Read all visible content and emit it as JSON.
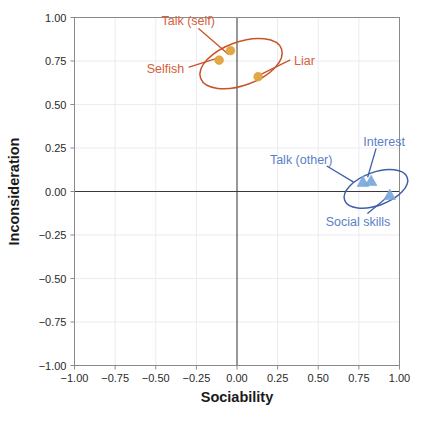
{
  "chart_data": {
    "type": "scatter",
    "title": "",
    "xlabel": "Sociability",
    "ylabel": "Inconsideration",
    "xlim": [
      -1.0,
      1.0
    ],
    "ylim": [
      -1.0,
      1.0
    ],
    "grid": true,
    "legend": "none",
    "zero_lines": true,
    "xticks": [
      "-1.00",
      "-0.75",
      "-0.50",
      "-0.25",
      "0.00",
      "0.25",
      "0.50",
      "0.75",
      "1.00"
    ],
    "xtick_values": [
      -1.0,
      -0.75,
      -0.5,
      -0.25,
      0.0,
      0.25,
      0.5,
      0.75,
      1.0
    ],
    "yticks": [
      "1.00",
      "0.75",
      "0.50",
      "0.25",
      "0.00",
      "-0.25",
      "-0.50",
      "-0.75",
      "-1.00"
    ],
    "ytick_values": [
      1.0,
      0.75,
      0.5,
      0.25,
      0.0,
      -0.25,
      -0.5,
      -0.75,
      -1.0
    ],
    "series": [
      {
        "name": "Negative cluster",
        "color": "#e0a33c",
        "outline_color": "#c8532a",
        "marker": "circle",
        "points": [
          {
            "label": "Talk (self)",
            "x": -0.04,
            "y": 0.81
          },
          {
            "label": "Selfish",
            "x": -0.11,
            "y": 0.755
          },
          {
            "label": "Liar",
            "x": 0.13,
            "y": 0.66
          }
        ],
        "ellipse": {
          "cx": 0.025,
          "cy": 0.735,
          "rx": 0.265,
          "ry": 0.125,
          "angle": -20
        }
      },
      {
        "name": "Positive cluster",
        "color": "#7ba7dc",
        "outline_color": "#3f5fa8",
        "marker": "triangle",
        "points": [
          {
            "label": "Talk (other)",
            "x": 0.775,
            "y": 0.055
          },
          {
            "label": "Interest",
            "x": 0.825,
            "y": 0.06
          },
          {
            "label": "Social skills",
            "x": 0.94,
            "y": -0.02
          }
        ],
        "ellipse": {
          "cx": 0.855,
          "cy": 0.015,
          "rx": 0.205,
          "ry": 0.095,
          "angle": -20
        }
      }
    ],
    "annotations": [
      {
        "text": "Talk (self)",
        "color": "#d4603a",
        "tx": -0.3,
        "ty": 0.985,
        "anchor": "middle"
      },
      {
        "text": "Selfish",
        "color": "#d4603a",
        "tx": -0.44,
        "ty": 0.705,
        "anchor": "middle"
      },
      {
        "text": "Liar",
        "color": "#d4603a",
        "tx": 0.415,
        "ty": 0.755,
        "anchor": "middle"
      },
      {
        "text": "Talk (other)",
        "color": "#5b7fc7",
        "tx": 0.395,
        "ty": 0.185,
        "anchor": "middle"
      },
      {
        "text": "Interest",
        "color": "#5b7fc7",
        "tx": 0.905,
        "ty": 0.285,
        "anchor": "middle"
      },
      {
        "text": "Social skills",
        "color": "#5b7fc7",
        "tx": 0.745,
        "ty": -0.175,
        "anchor": "middle"
      }
    ],
    "leader_lines": [
      {
        "color": "#c8532a",
        "x1": -0.235,
        "y1": 0.935,
        "x2": -0.055,
        "y2": 0.79
      },
      {
        "color": "#c8532a",
        "x1": -0.295,
        "y1": 0.715,
        "x2": -0.125,
        "y2": 0.765
      },
      {
        "color": "#c8532a",
        "x1": 0.325,
        "y1": 0.755,
        "x2": 0.15,
        "y2": 0.675
      },
      {
        "color": "#3f5fa8",
        "x1": 0.555,
        "y1": 0.145,
        "x2": 0.715,
        "y2": 0.055
      },
      {
        "color": "#3f5fa8",
        "x1": 0.855,
        "y1": 0.245,
        "x2": 0.805,
        "y2": 0.085
      },
      {
        "color": "#3f5fa8",
        "x1": 0.805,
        "y1": -0.125,
        "x2": 0.935,
        "y2": -0.025
      }
    ]
  },
  "figure": {
    "caption_fragment": ""
  }
}
